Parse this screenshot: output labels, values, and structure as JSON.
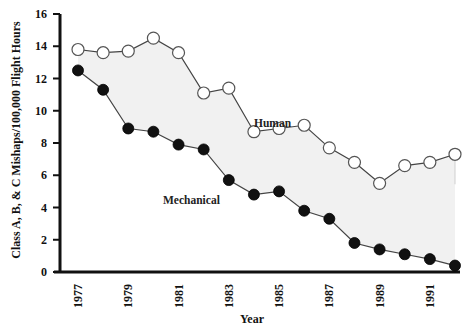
{
  "chart_data": {
    "type": "line",
    "title": "",
    "xlabel": "Year",
    "ylabel": "Class A, B, & C Mishaps/100,000 Flight Hours",
    "ylim": [
      0,
      16
    ],
    "yticks": [
      0,
      2,
      4,
      6,
      8,
      10,
      12,
      14,
      16
    ],
    "x": [
      1977,
      1978,
      1979,
      1980,
      1981,
      1982,
      1983,
      1984,
      1985,
      1986,
      1987,
      1988,
      1989,
      1990,
      1991,
      1992
    ],
    "xtick_labels": [
      "1977",
      "1979",
      "1981",
      "1983",
      "1985",
      "1987",
      "1989",
      "1991"
    ],
    "grid": false,
    "legend": "inline labels",
    "fill_between": true,
    "series": [
      {
        "name": "Human",
        "marker": "open-circle",
        "values": [
          13.8,
          13.6,
          13.7,
          14.5,
          13.6,
          11.1,
          11.4,
          8.7,
          8.9,
          9.1,
          7.7,
          6.8,
          5.5,
          6.6,
          6.8,
          7.3
        ]
      },
      {
        "name": "Mechanical",
        "marker": "filled-circle",
        "values": [
          12.5,
          11.3,
          8.9,
          8.7,
          7.9,
          7.6,
          5.7,
          4.8,
          5.0,
          3.8,
          3.3,
          1.8,
          1.4,
          1.1,
          0.8,
          0.4
        ]
      }
    ]
  },
  "labels": {
    "human": "Human",
    "mechanical": "Mechanical",
    "xlabel": "Year",
    "ylabel": "Class A, B, & C Mishaps/100,000 Flight Hours"
  },
  "colors": {
    "fill": "#f1f1f1",
    "line": "#444444",
    "marker_filled": "#111111",
    "axis": "#111111"
  }
}
